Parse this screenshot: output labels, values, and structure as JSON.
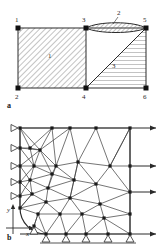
{
  "document": {
    "type": "engineering-figure",
    "subject": "Finite element discretization of a plate with a circular hole"
  },
  "figure_a": {
    "caption": "a",
    "description": "Quarter plate divided into three hatched sub-regions with six corner nodes",
    "node_labels": [
      "1",
      "2",
      "3",
      "4",
      "5",
      "6"
    ],
    "region_labels": [
      "1",
      "2",
      "3"
    ],
    "nodes": [
      {
        "id": "1",
        "label": "1",
        "x": 18,
        "y": 28
      },
      {
        "id": "2",
        "label": "2",
        "x": 18,
        "y": 88
      },
      {
        "id": "3",
        "label": "3",
        "x": 86,
        "y": 28
      },
      {
        "id": "4",
        "label": "4",
        "x": 86,
        "y": 88
      },
      {
        "id": "5",
        "label": "5",
        "x": 146,
        "y": 28
      },
      {
        "id": "6",
        "label": "6",
        "x": 146,
        "y": 88
      }
    ],
    "regions": [
      {
        "label": "1",
        "hatch": "diagonal-45",
        "shape": "rectangle-1-3-4-2"
      },
      {
        "label": "2",
        "hatch": "diagonal-45",
        "shape": "lens-3-5"
      },
      {
        "label": "3",
        "hatch": "horizontal",
        "shape": "triangle-4-5-6"
      }
    ]
  },
  "figure_b": {
    "caption": "b",
    "description": "Triangular finite element mesh of a quarter plate with a quarter circular hole",
    "axis_labels": {
      "x": "x",
      "y": "y"
    },
    "left_support_count": 5,
    "bottom_support_count": 6,
    "load_arrow_count": 4,
    "support_symbol": "roller-triangle",
    "load_symbol": "arrow-right"
  },
  "colors": {
    "ink": "#2a2a2a",
    "hatch": "#6a6a6a",
    "node": "#111111",
    "background": "#ffffff"
  }
}
